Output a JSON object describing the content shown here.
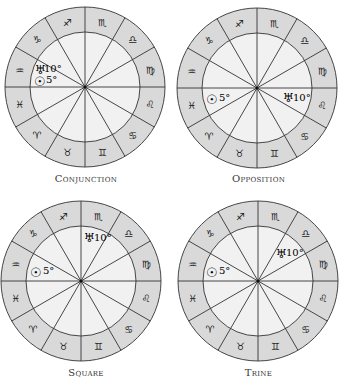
{
  "colors": {
    "outer_ring": "#d9d9d9",
    "inner_disc": "#f1f1f1",
    "lines": "#333333",
    "background": "#ffffff"
  },
  "zodiac_signs": [
    {
      "name": "aquarius",
      "glyph": "♒"
    },
    {
      "name": "capricorn",
      "glyph": "♑"
    },
    {
      "name": "sagittarius",
      "glyph": "♐"
    },
    {
      "name": "scorpio",
      "glyph": "♏"
    },
    {
      "name": "libra",
      "glyph": "♎"
    },
    {
      "name": "virgo",
      "glyph": "♍"
    },
    {
      "name": "leo",
      "glyph": "♌"
    },
    {
      "name": "cancer",
      "glyph": "♋"
    },
    {
      "name": "gemini",
      "glyph": "♊"
    },
    {
      "name": "taurus",
      "glyph": "♉"
    },
    {
      "name": "aries",
      "glyph": "♈"
    },
    {
      "name": "pisces",
      "glyph": "♓"
    }
  ],
  "charts": [
    {
      "id": "conjunction",
      "caption": "Conjunction",
      "planets": [
        {
          "name": "uranus",
          "glyph": "♅",
          "degree": "10°"
        },
        {
          "name": "sun",
          "glyph": "☉",
          "degree": "5°"
        }
      ]
    },
    {
      "id": "opposition",
      "caption": "Opposition",
      "planets": [
        {
          "name": "sun",
          "glyph": "☉",
          "degree": "5°"
        },
        {
          "name": "uranus",
          "glyph": "♅",
          "degree": "10°"
        }
      ]
    },
    {
      "id": "square",
      "caption": "Square",
      "planets": [
        {
          "name": "uranus",
          "glyph": "♅",
          "degree": "10°"
        },
        {
          "name": "sun",
          "glyph": "☉",
          "degree": "5°"
        }
      ]
    },
    {
      "id": "trine",
      "caption": "Trine",
      "planets": [
        {
          "name": "uranus",
          "glyph": "♅",
          "degree": "10°"
        },
        {
          "name": "sun",
          "glyph": "☉",
          "degree": "5°"
        }
      ]
    }
  ]
}
